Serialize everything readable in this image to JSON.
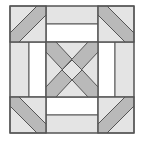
{
  "figure": {
    "title": "",
    "colors": {
      "background": "#ffffff",
      "light": "#e4e4e4",
      "white": "#ffffff",
      "band": "#b9b9b9",
      "stroke": "#555555"
    }
  }
}
